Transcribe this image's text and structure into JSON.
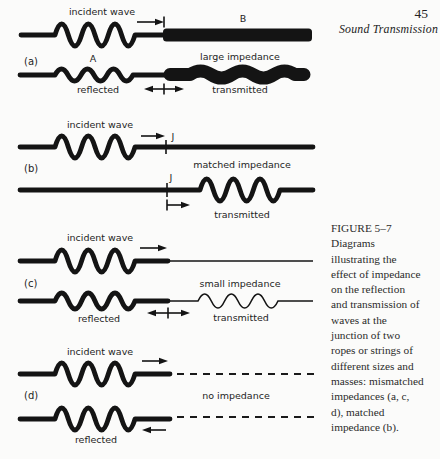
{
  "page": {
    "number": "45",
    "running_head": "Sound Transmission"
  },
  "caption": {
    "title": "FIGURE 5–7",
    "body": "Diagrams\nillustrating the\neffect of impedance\non the reflection\nand transmission of\nwaves at the\njunction of two\nropes or strings of\ndifferent sizes and\nmasses: mismatched\nimpedances (a, c,\nd), matched\nimpedance (b)."
  },
  "diagram": {
    "a": {
      "tag": "(a)",
      "incident_label": "incident wave",
      "rope_a_label": "A",
      "rope_b_label": "B",
      "impedance_label": "large impedance",
      "reflected_label": "reflected",
      "transmitted_label": "transmitted"
    },
    "b": {
      "tag": "(b)",
      "incident_label": "incident wave",
      "junction_top_label": "J",
      "junction_bottom_label": "J",
      "impedance_label": "matched impedance",
      "transmitted_label": "transmitted"
    },
    "c": {
      "tag": "(c)",
      "incident_label": "incident wave",
      "impedance_label": "small impedance",
      "reflected_label": "reflected",
      "transmitted_label": "transmitted"
    },
    "d": {
      "tag": "(d)",
      "incident_label": "incident wave",
      "impedance_label": "no impedance",
      "reflected_label": "reflected"
    }
  },
  "colors": {
    "ink": "#141414",
    "paper": "#fbfbfa",
    "caption_text": "#2b2b2b"
  }
}
